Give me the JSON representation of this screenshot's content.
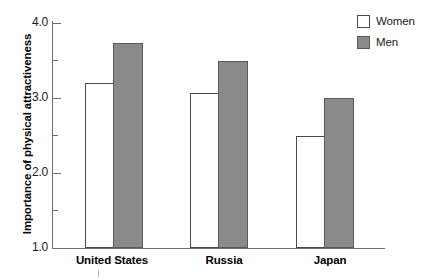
{
  "chart_data": {
    "type": "bar",
    "title": "",
    "subtitle": "",
    "xlabel": "",
    "ylabel": "Importance of physical attractiveness",
    "categories": [
      "United States",
      "Russia",
      "Japan"
    ],
    "series": [
      {
        "name": "Women",
        "values": [
          3.2,
          3.07,
          2.5
        ],
        "color": "#ffffff",
        "edge_color": "#4a4a4a"
      },
      {
        "name": "Men",
        "values": [
          3.73,
          3.5,
          3.0
        ],
        "color": "#8a8a8a",
        "edge_color": "#5a5a5a"
      }
    ],
    "ylim": [
      1.0,
      4.0
    ],
    "y_major_ticks": [
      "1.0",
      "2.0",
      "3.0",
      "4.0"
    ],
    "y_major_values": [
      1.0,
      2.0,
      3.0,
      4.0
    ],
    "y_minor_values": [
      1.5,
      2.5,
      3.5
    ],
    "grid": false,
    "legend_position": "top-right",
    "legend_entries": [
      "Women",
      "Men"
    ]
  },
  "axes": {
    "y_title": "Importance of physical attractiveness",
    "tick_labels": {
      "t40": "4.0",
      "t30": "3.0",
      "t20": "2.0",
      "t10": "1.0"
    }
  },
  "categories": [
    {
      "label": "United States"
    },
    {
      "label": "Russia"
    },
    {
      "label": "Japan"
    }
  ],
  "legend": {
    "items": [
      {
        "label": "Women"
      },
      {
        "label": "Men"
      }
    ]
  },
  "colors": {
    "bar_men_fill": "#8a8a8a",
    "bar_women_fill": "#ffffff",
    "axis": "#6e6e6e",
    "text": "#000000"
  }
}
